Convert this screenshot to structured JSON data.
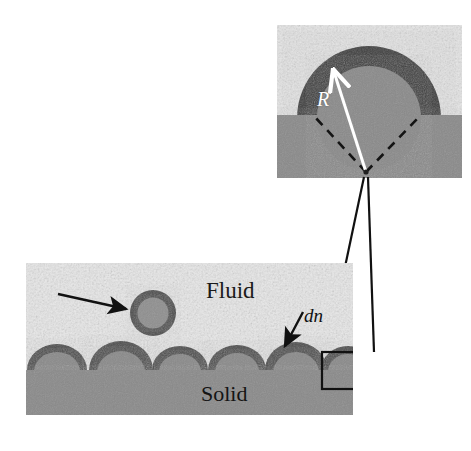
{
  "figure": {
    "background_color": "#ffffff"
  },
  "colors": {
    "fluid_light": "#e3e3e3",
    "fluid_speckle": "#b9b9b9",
    "solid_gray": "#8a8a8a",
    "nucleus_dark": "#4f4f4f",
    "particle_core": "#8f8f8f",
    "line_black": "#111111",
    "arrow_white": "#ffffff"
  },
  "main_panel": {
    "name": "main-schematic",
    "fluid_label": "Fluid",
    "solid_label": "Solid",
    "dn_label": "dn",
    "free_particle": {
      "name": "free-particle",
      "center_x": 153,
      "center_y": 313,
      "outer_radius": 23,
      "inner_radius": 15
    },
    "pointer_arrow": {
      "name": "free-particle-arrow",
      "from_x": 58,
      "from_y": 294,
      "to_x": 128,
      "to_y": 309
    },
    "dn_arrow": {
      "name": "dn-arrow",
      "from_x": 302,
      "from_y": 313,
      "to_x": 283,
      "to_y": 348
    },
    "substrate": {
      "name": "solid-substrate",
      "top_y": 370,
      "bottom_y": 415,
      "left_x": 26,
      "right_x": 353
    },
    "nuclei": [
      {
        "cx": 57,
        "cy": 370,
        "rx": 30,
        "ry": 26,
        "rim": 7
      },
      {
        "cx": 121,
        "cy": 370,
        "rx": 32,
        "ry": 29,
        "rim": 8
      },
      {
        "cx": 180,
        "cy": 370,
        "rx": 28,
        "ry": 24,
        "rim": 7
      },
      {
        "cx": 237,
        "cy": 370,
        "rx": 29,
        "ry": 25,
        "rim": 7
      },
      {
        "cx": 296,
        "cy": 370,
        "rx": 31,
        "ry": 28,
        "rim": 8
      },
      {
        "cx": 348,
        "cy": 370,
        "rx": 27,
        "ry": 24,
        "rim": 7
      }
    ],
    "callout_box": {
      "name": "callout-box",
      "x": 322,
      "y": 352,
      "width": 53,
      "height": 37
    }
  },
  "inset_panel": {
    "name": "inset-detail",
    "x": 277,
    "y": 25,
    "width": 185,
    "height": 153,
    "solid_top_y": 115,
    "radius_label": "R",
    "cap": {
      "name": "nucleus-cap",
      "center_x": 369,
      "center_y": 118,
      "outer_radius": 72,
      "inner_radius": 52
    },
    "radius_arrow": {
      "name": "radius-arrow",
      "from_x": 366,
      "from_y": 172,
      "to_x": 334,
      "to_y": 72
    },
    "dashed_cone": {
      "name": "contact-angle-cone",
      "apex_x": 366,
      "apex_y": 172,
      "left_x": 314,
      "left_y": 115,
      "right_x": 420,
      "right_y": 115
    }
  },
  "connectors": {
    "name": "magnifier-connector-lines",
    "lines": [
      {
        "x1": 364,
        "y1": 176,
        "x2": 327,
        "y2": 352
      },
      {
        "x1": 368,
        "y1": 176,
        "x2": 374,
        "y2": 352
      }
    ]
  }
}
